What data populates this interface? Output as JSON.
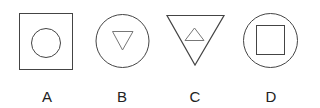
{
  "options": [
    {
      "label": "A",
      "outer": "square",
      "inner": "circle"
    },
    {
      "label": "B",
      "outer": "circle",
      "inner": "inverted-triangle"
    },
    {
      "label": "C",
      "outer": "inverted-triangle",
      "inner": "triangle"
    },
    {
      "label": "D",
      "outer": "circle",
      "inner": "square"
    }
  ],
  "stroke_color": "#444444"
}
